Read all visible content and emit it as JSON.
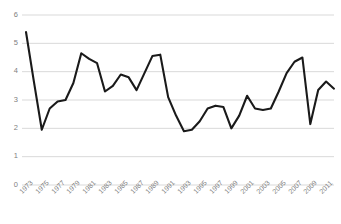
{
  "chart_data": {
    "type": "line",
    "title": "",
    "subtitle": "",
    "xlabel": "",
    "ylabel": "",
    "grid": true,
    "legend": null,
    "legend_position": "none",
    "line_color": "#1a1a1a",
    "grid_color": "#d9d9d9",
    "axis_label_color": "#808080",
    "background_color": "#ffffff",
    "xlim": [
      1973,
      2012
    ],
    "ylim": [
      0,
      6
    ],
    "y_ticks": [
      0,
      1,
      2,
      3,
      4,
      5,
      6
    ],
    "y_tick_labels": [
      "0",
      "1",
      "2",
      "3",
      "4",
      "5",
      "6"
    ],
    "x_ticks": [
      1973,
      1975,
      1977,
      1979,
      1981,
      1983,
      1985,
      1987,
      1989,
      1991,
      1993,
      1995,
      1997,
      1999,
      2001,
      2003,
      2005,
      2007,
      2009,
      2011
    ],
    "x_tick_labels": [
      "1973",
      "1975",
      "1977",
      "1979",
      "1981",
      "1983",
      "1985",
      "1987",
      "1989",
      "1991",
      "1993",
      "1995",
      "1997",
      "1999",
      "2001",
      "2003",
      "2005",
      "2007",
      "2009",
      "2011"
    ],
    "x": [
      1973,
      1974,
      1975,
      1976,
      1977,
      1978,
      1979,
      1980,
      1981,
      1982,
      1983,
      1984,
      1985,
      1986,
      1987,
      1988,
      1989,
      1990,
      1991,
      1992,
      1993,
      1994,
      1995,
      1996,
      1997,
      1998,
      1999,
      2000,
      2001,
      2002,
      2003,
      2004,
      2005,
      2006,
      2007,
      2008,
      2009,
      2010,
      2011,
      2012
    ],
    "values": [
      5.4,
      3.65,
      1.95,
      2.7,
      2.95,
      3.0,
      3.6,
      4.65,
      4.45,
      4.3,
      3.3,
      3.5,
      3.9,
      3.8,
      3.35,
      3.95,
      4.55,
      4.6,
      3.1,
      2.45,
      1.9,
      1.95,
      2.25,
      2.7,
      2.8,
      2.75,
      2.0,
      2.45,
      3.15,
      2.7,
      2.65,
      2.7,
      3.3,
      3.95,
      4.35,
      4.5,
      2.15,
      3.35,
      3.65,
      3.4
    ]
  }
}
